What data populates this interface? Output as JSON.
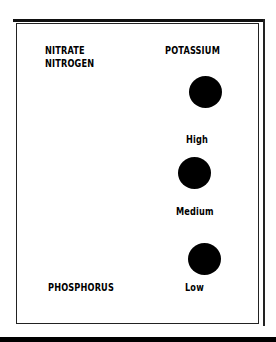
{
  "diagram": {
    "nutrients": {
      "nitrate_nitrogen": {
        "line1": "NITRATE",
        "line2": "NITROGEN"
      },
      "potassium": "POTASSIUM",
      "phosphorus": "PHOSPHORUS"
    },
    "levels": [
      {
        "label": "High"
      },
      {
        "label": "Medium"
      },
      {
        "label": "Low"
      }
    ],
    "dot_color": "#000000"
  }
}
